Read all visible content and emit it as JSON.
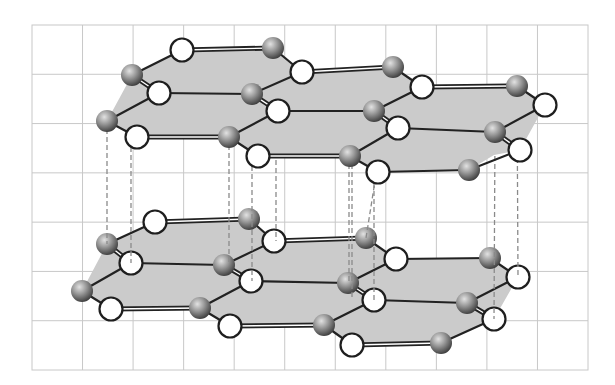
{
  "figure": {
    "background": "#ffffff",
    "grid": {
      "left": 32,
      "top": 25,
      "right": 588,
      "bottom": 370,
      "cols": 11,
      "rows": 7,
      "color": "#c8c8c8"
    },
    "colors": {
      "plane_fill": "#cbcbcb",
      "bond": "#222222",
      "white_atom_fill": "#ffffff",
      "white_atom_stroke": "#1e1e1e",
      "gray_atom_light": "#d8d8d8",
      "gray_atom_dark": "#4a4a4a",
      "dashed_link": "#8a8a8a"
    },
    "atom_radius": {
      "white": 11.5,
      "gray": 11
    },
    "layers": [
      {
        "name": "top-layer",
        "planes": [
          [
            [
              132,
              75
            ],
            [
              182,
              50
            ],
            [
              273,
              48
            ],
            [
              302,
              72
            ],
            [
              393,
              67
            ],
            [
              422,
              87
            ],
            [
              517,
              86
            ],
            [
              545,
              105
            ],
            [
              520,
              150
            ],
            [
              494,
              155
            ],
            [
              469,
              170
            ],
            [
              378,
              172
            ],
            [
              350,
              156
            ],
            [
              258,
              156
            ],
            [
              229,
              137
            ],
            [
              137,
              137
            ],
            [
              107,
              121
            ]
          ]
        ],
        "atoms": [
          {
            "id": "t1",
            "type": "white",
            "x": 182,
            "y": 50
          },
          {
            "id": "t2",
            "type": "gray",
            "x": 273,
            "y": 48
          },
          {
            "id": "t3",
            "type": "gray",
            "x": 132,
            "y": 75
          },
          {
            "id": "t4",
            "type": "white",
            "x": 302,
            "y": 72
          },
          {
            "id": "t5",
            "type": "white",
            "x": 159,
            "y": 93
          },
          {
            "id": "t6",
            "type": "gray",
            "x": 252,
            "y": 94
          },
          {
            "id": "t7",
            "type": "gray",
            "x": 393,
            "y": 67
          },
          {
            "id": "t8",
            "type": "white",
            "x": 422,
            "y": 87
          },
          {
            "id": "t9",
            "type": "gray",
            "x": 517,
            "y": 86
          },
          {
            "id": "t10",
            "type": "white",
            "x": 545,
            "y": 105
          },
          {
            "id": "t11",
            "type": "white",
            "x": 278,
            "y": 111
          },
          {
            "id": "t12",
            "type": "gray",
            "x": 374,
            "y": 111
          },
          {
            "id": "t13",
            "type": "gray",
            "x": 107,
            "y": 121
          },
          {
            "id": "t14",
            "type": "white",
            "x": 398,
            "y": 128
          },
          {
            "id": "t15",
            "type": "gray",
            "x": 495,
            "y": 132
          },
          {
            "id": "t16",
            "type": "white",
            "x": 137,
            "y": 137
          },
          {
            "id": "t17",
            "type": "gray",
            "x": 229,
            "y": 137
          },
          {
            "id": "t18",
            "type": "white",
            "x": 520,
            "y": 150
          },
          {
            "id": "t19",
            "type": "white",
            "x": 258,
            "y": 156
          },
          {
            "id": "t20",
            "type": "gray",
            "x": 350,
            "y": 156
          },
          {
            "id": "t21",
            "type": "white",
            "x": 378,
            "y": 172
          },
          {
            "id": "t22",
            "type": "gray",
            "x": 469,
            "y": 170
          }
        ],
        "bonds": [
          {
            "a": "t3",
            "b": "t1",
            "kind": "single"
          },
          {
            "a": "t1",
            "b": "t2",
            "kind": "double"
          },
          {
            "a": "t2",
            "b": "t4",
            "kind": "single"
          },
          {
            "a": "t4",
            "b": "t7",
            "kind": "double"
          },
          {
            "a": "t7",
            "b": "t8",
            "kind": "single"
          },
          {
            "a": "t8",
            "b": "t9",
            "kind": "double"
          },
          {
            "a": "t9",
            "b": "t10",
            "kind": "single"
          },
          {
            "a": "t3",
            "b": "t5",
            "kind": "double"
          },
          {
            "a": "t5",
            "b": "t6",
            "kind": "single"
          },
          {
            "a": "t6",
            "b": "t4",
            "kind": "single"
          },
          {
            "a": "t6",
            "b": "t11",
            "kind": "double"
          },
          {
            "a": "t11",
            "b": "t12",
            "kind": "single"
          },
          {
            "a": "t12",
            "b": "t8",
            "kind": "single"
          },
          {
            "a": "t12",
            "b": "t14",
            "kind": "double"
          },
          {
            "a": "t14",
            "b": "t15",
            "kind": "single"
          },
          {
            "a": "t15",
            "b": "t10",
            "kind": "single"
          },
          {
            "a": "t15",
            "b": "t18",
            "kind": "double"
          },
          {
            "a": "t13",
            "b": "t5",
            "kind": "single"
          },
          {
            "a": "t13",
            "b": "t16",
            "kind": "single"
          },
          {
            "a": "t16",
            "b": "t17",
            "kind": "double"
          },
          {
            "a": "t17",
            "b": "t11",
            "kind": "single"
          },
          {
            "a": "t17",
            "b": "t19",
            "kind": "single"
          },
          {
            "a": "t19",
            "b": "t20",
            "kind": "double"
          },
          {
            "a": "t20",
            "b": "t14",
            "kind": "single"
          },
          {
            "a": "t20",
            "b": "t21",
            "kind": "single"
          },
          {
            "a": "t21",
            "b": "t22",
            "kind": "single"
          },
          {
            "a": "t22",
            "b": "t18",
            "kind": "single"
          }
        ]
      },
      {
        "name": "bottom-layer",
        "planes": [
          [
            [
              107,
              244
            ],
            [
              155,
              222
            ],
            [
              249,
              219
            ],
            [
              274,
              241
            ],
            [
              366,
              238
            ],
            [
              396,
              259
            ],
            [
              490,
              258
            ],
            [
              518,
              277
            ],
            [
              494,
              319
            ],
            [
              441,
              343
            ],
            [
              352,
              345
            ],
            [
              324,
              325
            ],
            [
              230,
              326
            ],
            [
              200,
              308
            ],
            [
              111,
              309
            ],
            [
              82,
              291
            ]
          ]
        ],
        "atoms": [
          {
            "id": "b1",
            "type": "white",
            "x": 155,
            "y": 222
          },
          {
            "id": "b2",
            "type": "gray",
            "x": 249,
            "y": 219
          },
          {
            "id": "b3",
            "type": "gray",
            "x": 107,
            "y": 244
          },
          {
            "id": "b4",
            "type": "white",
            "x": 274,
            "y": 241
          },
          {
            "id": "b5",
            "type": "white",
            "x": 131,
            "y": 263
          },
          {
            "id": "b6",
            "type": "gray",
            "x": 224,
            "y": 265
          },
          {
            "id": "b7",
            "type": "gray",
            "x": 366,
            "y": 238
          },
          {
            "id": "b8",
            "type": "white",
            "x": 396,
            "y": 259
          },
          {
            "id": "b9",
            "type": "gray",
            "x": 490,
            "y": 258
          },
          {
            "id": "b10",
            "type": "white",
            "x": 518,
            "y": 277
          },
          {
            "id": "b11",
            "type": "white",
            "x": 251,
            "y": 281
          },
          {
            "id": "b12",
            "type": "gray",
            "x": 348,
            "y": 283
          },
          {
            "id": "b13",
            "type": "gray",
            "x": 82,
            "y": 291
          },
          {
            "id": "b14",
            "type": "white",
            "x": 374,
            "y": 300
          },
          {
            "id": "b15",
            "type": "gray",
            "x": 467,
            "y": 303
          },
          {
            "id": "b16",
            "type": "white",
            "x": 111,
            "y": 309
          },
          {
            "id": "b17",
            "type": "gray",
            "x": 200,
            "y": 308
          },
          {
            "id": "b18",
            "type": "white",
            "x": 494,
            "y": 319
          },
          {
            "id": "b19",
            "type": "white",
            "x": 230,
            "y": 326
          },
          {
            "id": "b20",
            "type": "gray",
            "x": 324,
            "y": 325
          },
          {
            "id": "b21",
            "type": "white",
            "x": 352,
            "y": 345
          },
          {
            "id": "b22",
            "type": "gray",
            "x": 441,
            "y": 343
          }
        ],
        "bonds": [
          {
            "a": "b3",
            "b": "b1",
            "kind": "single"
          },
          {
            "a": "b1",
            "b": "b2",
            "kind": "double"
          },
          {
            "a": "b2",
            "b": "b4",
            "kind": "single"
          },
          {
            "a": "b4",
            "b": "b7",
            "kind": "double"
          },
          {
            "a": "b7",
            "b": "b8",
            "kind": "single"
          },
          {
            "a": "b8",
            "b": "b9",
            "kind": "single"
          },
          {
            "a": "b9",
            "b": "b10",
            "kind": "single"
          },
          {
            "a": "b3",
            "b": "b5",
            "kind": "double"
          },
          {
            "a": "b5",
            "b": "b6",
            "kind": "single"
          },
          {
            "a": "b6",
            "b": "b4",
            "kind": "single"
          },
          {
            "a": "b6",
            "b": "b11",
            "kind": "double"
          },
          {
            "a": "b11",
            "b": "b12",
            "kind": "single"
          },
          {
            "a": "b12",
            "b": "b8",
            "kind": "single"
          },
          {
            "a": "b12",
            "b": "b14",
            "kind": "double"
          },
          {
            "a": "b14",
            "b": "b15",
            "kind": "single"
          },
          {
            "a": "b15",
            "b": "b10",
            "kind": "single"
          },
          {
            "a": "b15",
            "b": "b18",
            "kind": "double"
          },
          {
            "a": "b13",
            "b": "b5",
            "kind": "single"
          },
          {
            "a": "b13",
            "b": "b16",
            "kind": "single"
          },
          {
            "a": "b16",
            "b": "b17",
            "kind": "double"
          },
          {
            "a": "b17",
            "b": "b11",
            "kind": "single"
          },
          {
            "a": "b17",
            "b": "b19",
            "kind": "single"
          },
          {
            "a": "b19",
            "b": "b20",
            "kind": "double"
          },
          {
            "a": "b20",
            "b": "b14",
            "kind": "single"
          },
          {
            "a": "b20",
            "b": "b21",
            "kind": "single"
          },
          {
            "a": "b21",
            "b": "b22",
            "kind": "double"
          },
          {
            "a": "b22",
            "b": "b18",
            "kind": "single"
          }
        ]
      }
    ],
    "interlayer_links": [
      {
        "x1": 107,
        "y1": 121,
        "x2": 107,
        "y2": 244
      },
      {
        "x1": 131,
        "y1": 75,
        "x2": 131,
        "y2": 263
      },
      {
        "x1": 229,
        "y1": 137,
        "x2": 229,
        "y2": 265
      },
      {
        "x1": 252,
        "y1": 94,
        "x2": 252,
        "y2": 281
      },
      {
        "x1": 276,
        "y1": 48,
        "x2": 276,
        "y2": 241
      },
      {
        "x1": 349,
        "y1": 156,
        "x2": 349,
        "y2": 283
      },
      {
        "x1": 352,
        "y1": 156,
        "x2": 352,
        "y2": 300
      },
      {
        "x1": 374,
        "y1": 111,
        "x2": 374,
        "y2": 300
      },
      {
        "x1": 393,
        "y1": 67,
        "x2": 366,
        "y2": 238
      },
      {
        "x1": 495,
        "y1": 132,
        "x2": 494,
        "y2": 319
      },
      {
        "x1": 517,
        "y1": 86,
        "x2": 518,
        "y2": 277
      }
    ]
  }
}
